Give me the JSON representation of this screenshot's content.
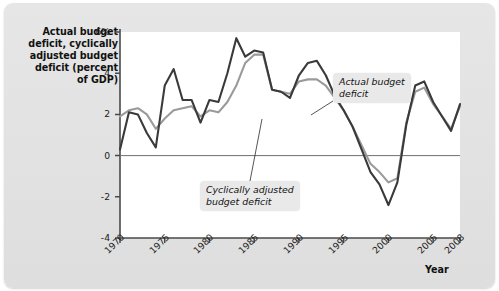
{
  "figure": {
    "y_axis_title": "Actual budget\ndeficit, cyclically\nadjusted budget\ndeficit (percent\nof GDP)",
    "x_axis_title": "Year",
    "annotations": {
      "actual": "Actual budget\ndeficit",
      "cyclical": "Cyclically adjusted\nbudget deficit"
    }
  },
  "colors": {
    "actual_line": "#3a3a3a",
    "cyclical_line": "#9a9a9a",
    "axis": "#4a4a4a",
    "zero_line": "#707070",
    "plot_background": "#ffffff",
    "panel_background": "#e3e3e3",
    "callout_background": "#e9e9e9"
  },
  "chart_data": {
    "type": "line",
    "title": "",
    "xlabel": "Year",
    "ylabel": "Actual budget deficit, cyclically adjusted budget deficit (percent of GDP)",
    "xlim": [
      1970,
      2008
    ],
    "ylim": [
      -4,
      6
    ],
    "yticks": [
      6,
      4,
      2,
      0,
      -2,
      -4
    ],
    "ytick_labels": [
      "6%",
      "4",
      "2",
      "0",
      "-2",
      "-4"
    ],
    "xticks": [
      1970,
      1975,
      1980,
      1985,
      1990,
      1995,
      2000,
      2005,
      2008
    ],
    "xtick_labels": [
      "1970",
      "1975",
      "1980",
      "1985",
      "1990",
      "1995",
      "2000",
      "2005",
      "2008"
    ],
    "grid": false,
    "legend": "annotated-callouts",
    "x": [
      1970,
      1971,
      1972,
      1973,
      1974,
      1975,
      1976,
      1977,
      1978,
      1979,
      1980,
      1981,
      1982,
      1983,
      1984,
      1985,
      1986,
      1987,
      1988,
      1989,
      1990,
      1991,
      1992,
      1993,
      1994,
      1995,
      1996,
      1997,
      1998,
      1999,
      2000,
      2001,
      2002,
      2003,
      2004,
      2005,
      2006,
      2007,
      2008
    ],
    "series": [
      {
        "name": "Actual budget deficit",
        "color": "#3a3a3a",
        "values": [
          0.3,
          2.1,
          2.0,
          1.1,
          0.4,
          3.4,
          4.2,
          2.7,
          2.7,
          1.6,
          2.7,
          2.6,
          4.0,
          5.7,
          4.8,
          5.1,
          5.0,
          3.2,
          3.1,
          2.8,
          3.9,
          4.5,
          4.6,
          3.9,
          2.9,
          2.2,
          1.4,
          0.3,
          -0.8,
          -1.4,
          -2.4,
          -1.3,
          1.5,
          3.4,
          3.6,
          2.6,
          1.9,
          1.2,
          2.5
        ]
      },
      {
        "name": "Cyclically adjusted budget deficit",
        "color": "#9a9a9a",
        "values": [
          1.9,
          2.2,
          2.3,
          2.0,
          1.3,
          1.8,
          2.2,
          2.3,
          2.4,
          1.9,
          2.2,
          2.1,
          2.6,
          3.4,
          4.5,
          4.9,
          4.9,
          3.2,
          3.1,
          3.0,
          3.6,
          3.7,
          3.7,
          3.4,
          2.8,
          2.2,
          1.4,
          0.5,
          -0.4,
          -0.8,
          -1.3,
          -1.1,
          1.6,
          3.1,
          3.3,
          2.5,
          1.9,
          1.3,
          2.4
        ]
      }
    ]
  }
}
